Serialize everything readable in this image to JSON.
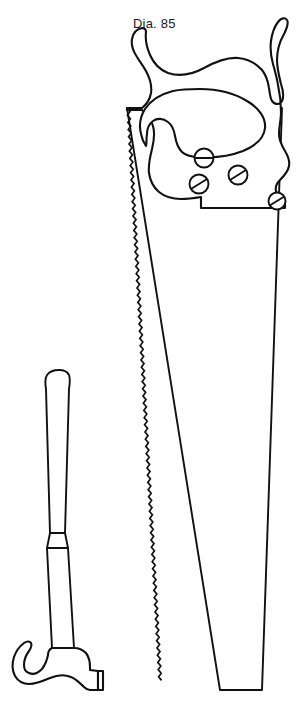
{
  "drawing": {
    "title": "Handsaw and claw hammer technical line drawing",
    "background_color": "#ffffff",
    "stroke_color": "#111111",
    "fill_color": "#ffffff",
    "canvas": {
      "width": 306,
      "height": 723
    },
    "annotations": [
      {
        "id": "dia-85",
        "text": "Dia. 85",
        "x": 133,
        "y": 16,
        "font_size": 13,
        "color": "#1a1a1a"
      }
    ],
    "objects": [
      {
        "name": "handsaw",
        "label": "Handsaw",
        "parts": [
          {
            "name": "saw-handle",
            "label": "Saw handle"
          },
          {
            "name": "saw-grip-hole",
            "label": "Grip hole"
          },
          {
            "name": "saw-blade",
            "label": "Saw blade"
          },
          {
            "name": "saw-teeth",
            "label": "Toothed cutting edge"
          },
          {
            "name": "saw-screws",
            "label": "Handle fastening screws",
            "count": 4
          }
        ]
      },
      {
        "name": "claw-hammer",
        "label": "Claw hammer",
        "parts": [
          {
            "name": "hammer-handle",
            "label": "Hammer handle"
          },
          {
            "name": "hammer-grip-band",
            "label": "Handle grip band"
          },
          {
            "name": "hammer-claw",
            "label": "Claw"
          },
          {
            "name": "hammer-head",
            "label": "Hammer head"
          },
          {
            "name": "hammer-face",
            "label": "Striking face"
          }
        ]
      }
    ],
    "screws": [
      {
        "id": "screw-1",
        "cx": 204,
        "cy": 158,
        "r": 9.5,
        "slot_angle": 0
      },
      {
        "id": "screw-2",
        "cx": 199,
        "cy": 184,
        "r": 9.5,
        "slot_angle": -32
      },
      {
        "id": "screw-3",
        "cx": 238,
        "cy": 175,
        "r": 9.5,
        "slot_angle": -32
      },
      {
        "id": "screw-4",
        "cx": 277,
        "cy": 201,
        "r": 8.5,
        "slot_angle": -32
      }
    ]
  }
}
